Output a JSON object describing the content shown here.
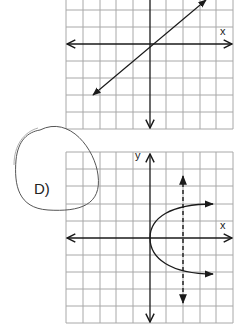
{
  "graphs": [
    {
      "id": "top",
      "x_label": "x",
      "y_label": "",
      "curve": "line through origin, slope ~ 1 (y = x)",
      "origin_px": [
        150,
        44
      ]
    },
    {
      "id": "D",
      "option_label": "D)",
      "x_label": "x",
      "y_label": "y",
      "curve": "parabola opening right, vertex at origin (x = y^2)",
      "vertical_line_test": "dashed vertical line at x = 2",
      "origin_px": [
        150,
        238
      ]
    }
  ],
  "colors": {
    "grid": "#a8a8a8",
    "axis": "#1a1a1a",
    "curve": "#1a1a1a",
    "circle": "#555555"
  }
}
